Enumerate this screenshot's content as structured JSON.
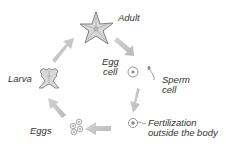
{
  "diagram": {
    "type": "life-cycle",
    "colors": {
      "arrow": "#c4c4c4",
      "organism": "#8a8a8a",
      "organism_fill": "#d9d9d9",
      "text": "#333333",
      "background": "#ffffff"
    },
    "stages": [
      {
        "id": "adult",
        "label": "Adult",
        "icon": "starfish-icon"
      },
      {
        "id": "egg-cell",
        "label_line1": "Egg",
        "label_line2": "cell",
        "icon": "egg-cell-icon"
      },
      {
        "id": "sperm-cell",
        "label_line1": "Sperm",
        "label_line2": "cell",
        "icon": "sperm-cell-icon"
      },
      {
        "id": "fertilization",
        "label_line1": "Fertilization",
        "label_line2": "outside the body",
        "icon": "fertilized-egg-icon"
      },
      {
        "id": "eggs",
        "label": "Eggs",
        "icon": "eggs-cluster-icon"
      },
      {
        "id": "larva",
        "label": "Larva",
        "icon": "larva-icon"
      }
    ],
    "flow": [
      "Adult",
      "Egg cell / Sperm cell",
      "Fertilization outside the body",
      "Eggs",
      "Larva",
      "Adult"
    ]
  }
}
